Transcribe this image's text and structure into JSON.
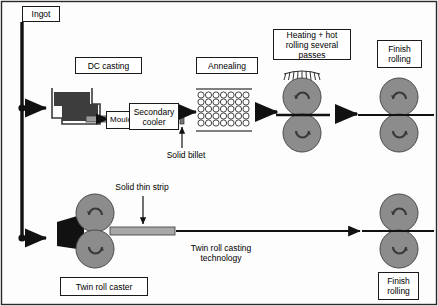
{
  "diagram": {
    "title_labels": {
      "ingot": "Ingot",
      "dc_casting": "DC casting",
      "mould": "Mould",
      "secondary_cooler": "Secondary\ncooler",
      "annealing": "Annealing",
      "heating_hot_rolling": "Heating + hot\nrolling several\npasses",
      "finish_rolling_top": "Finish\nrolling",
      "twin_roll_caster": "Twin roll caster",
      "finish_rolling_bottom": "Finish\nrolling"
    },
    "annotations": {
      "solid_billet": "Solid billet",
      "solid_thin_strip": "Solid thin strip",
      "twin_roll_casting_technology": "Twin roll casting\ntechnology"
    },
    "colors": {
      "line": "#1a1a1a",
      "roller_fill": "#8c8c8c",
      "melt_fill": "#3d3d3d",
      "strip_fill": "#a8a8a8",
      "background": "#fdfdfd",
      "box_fill": "#ffffff"
    },
    "annealing_grid": {
      "columns": 7,
      "rows": 5,
      "billet_shape": "circle"
    },
    "roll_stands": [
      {
        "name": "hot-rolling-stand",
        "heated": true,
        "rolls": 2
      },
      {
        "name": "finish-rolling-stand-top",
        "heated": false,
        "rolls": 2
      },
      {
        "name": "twin-roll-caster-stand",
        "heated": false,
        "rolls": 2
      },
      {
        "name": "finish-rolling-stand-bottom",
        "heated": false,
        "rolls": 2
      }
    ]
  }
}
